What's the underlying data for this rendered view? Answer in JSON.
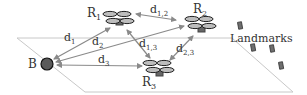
{
  "diagram": {
    "type": "multi-robot localization schematic",
    "colors": {
      "plane_edge": "#c8c8c8",
      "arrow": "#8a8a8a",
      "rotor_fill": "#bdbdbd",
      "rotor_stroke": "#222222",
      "body_fill": "#666666",
      "base_fill": "#5a5a5a",
      "landmark_fill": "#6e6e6e",
      "text": "#333333"
    },
    "nodes": {
      "base": {
        "label": "B",
        "x": 50,
        "y": 64
      },
      "robots": [
        {
          "id": "R1",
          "label": "R",
          "sub": "1",
          "x": 118,
          "y": 19
        },
        {
          "id": "R2",
          "label": "R",
          "sub": "2",
          "x": 200,
          "y": 24
        },
        {
          "id": "R3",
          "label": "R",
          "sub": "3",
          "x": 163,
          "y": 68
        }
      ]
    },
    "edges": [
      {
        "from": "B",
        "to": "R1",
        "label": "d",
        "sub": "1"
      },
      {
        "from": "B",
        "to": "R2",
        "label": "d",
        "sub": "2"
      },
      {
        "from": "B",
        "to": "R3",
        "label": "d",
        "sub": "3"
      },
      {
        "from": "R1",
        "to": "R2",
        "label": "d",
        "sub": "1,2"
      },
      {
        "from": "R1",
        "to": "R3",
        "label": "d",
        "sub": "1,3"
      },
      {
        "from": "R2",
        "to": "R3",
        "label": "d",
        "sub": "2,3"
      }
    ],
    "landmarks": {
      "label": "Landmarks",
      "count": 5
    }
  }
}
